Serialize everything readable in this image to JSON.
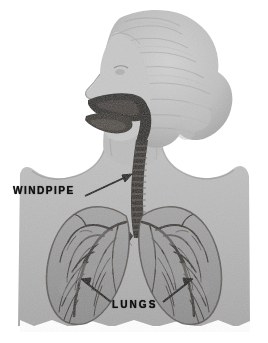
{
  "figure": {
    "style": "vintage halftone grayscale illustration",
    "background_color": "#ffffff",
    "body_color": "#b9b9b9",
    "body_shadow_color": "#a3a3a3",
    "hair_color": "#c6c6c6",
    "lung_color": "#9a9a9a",
    "airway_color": "#2a2623",
    "label_color": "#111111"
  },
  "labels": {
    "windpipe": "WINDPIPE",
    "lungs": "LUNGS"
  },
  "parts": {
    "head": "head-profile",
    "hair": "wavy-hair",
    "nasal_cavity": "nasal-cavity",
    "mouth": "open-mouth",
    "tongue": "tongue",
    "pharynx": "pharynx",
    "trachea": "trachea-with-cartilage-rings",
    "carina": "carina-bifurcation",
    "left_bronchus": "left-main-bronchus",
    "right_bronchus": "right-main-bronchus",
    "left_lung": "left-lung",
    "right_lung": "right-lung",
    "neck": "neck",
    "left_shoulder": "left-shoulder",
    "right_shoulder": "right-shoulder",
    "torso": "torso"
  },
  "leaders": {
    "windpipe_line": "windpipe-leader-line",
    "lungs_line_left": "lungs-leader-line-left",
    "lungs_line_right": "lungs-leader-line-right"
  }
}
